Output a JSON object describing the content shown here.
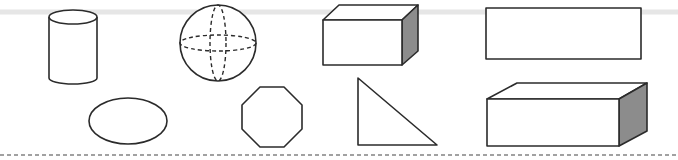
{
  "figure": {
    "title": "",
    "shapes": [
      {
        "id": "cylinder",
        "label": "cylinder"
      },
      {
        "id": "sphere",
        "label": "sphere"
      },
      {
        "id": "cuboid-small",
        "label": "cuboid"
      },
      {
        "id": "rectangle",
        "label": "rectangle"
      },
      {
        "id": "ellipse",
        "label": "ellipse"
      },
      {
        "id": "octagon",
        "label": "octagon"
      },
      {
        "id": "right-triangle",
        "label": "right triangle"
      },
      {
        "id": "cuboid-long",
        "label": "cuboid"
      }
    ],
    "colors": {
      "stroke": "#2b2b2b",
      "shaded_face": "#8c8c8c",
      "background": "#ffffff"
    }
  }
}
